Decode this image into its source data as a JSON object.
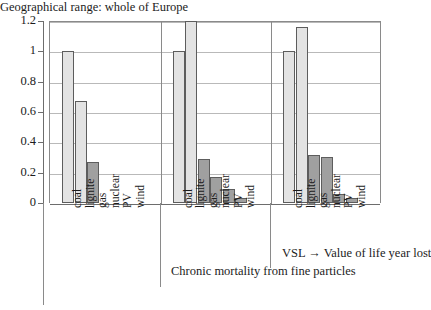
{
  "chart_data": {
    "type": "bar",
    "title": "",
    "xlabel": "",
    "ylabel": "",
    "ylim": [
      0,
      1.2
    ],
    "yticks": [
      0,
      0.2,
      0.4,
      0.6,
      0.8,
      1,
      1.2
    ],
    "ytick_labels": [
      "0",
      "0.2",
      "0.4",
      "0.6",
      "0.8",
      "1",
      "1.2"
    ],
    "grid": true,
    "legend": "none",
    "categories": [
      "coal",
      "lignite",
      "gas",
      "nuclear",
      "PV",
      "wind"
    ],
    "groups": [
      {
        "name": "group-1",
        "values": [
          1.0,
          0.67,
          0.27,
          0.0,
          0.0,
          0.0
        ],
        "shades": [
          "light",
          "light",
          "dark",
          "dark",
          "dark",
          "dark"
        ]
      },
      {
        "name": "group-2",
        "values": [
          1.0,
          1.2,
          0.29,
          0.17,
          0.09,
          0.03
        ],
        "shades": [
          "light",
          "light",
          "dark",
          "dark",
          "dark",
          "dark"
        ]
      },
      {
        "name": "group-3",
        "values": [
          1.0,
          1.16,
          0.315,
          0.305,
          0.06,
          0.03
        ],
        "shades": [
          "light",
          "light",
          "dark",
          "dark",
          "dark",
          "dark"
        ]
      }
    ],
    "annotations": [
      "VSL → Value of life year lost",
      "Chronic mortality from fine particles",
      "Geographical range: whole of Europe"
    ],
    "colors": {
      "bar_light": "#e3e3e3",
      "bar_dark": "#a0a0a0",
      "bar_outline": "#5d5d5d",
      "gridline": "#b9b9b9",
      "axis": "#6d6d6d",
      "background": "#ffffff",
      "text": "#1c1c1c"
    }
  },
  "captions": {
    "vsl": "VSL → Value of life year lost",
    "chronic": "Chronic mortality from fine particles",
    "geographical": "Geographical range: whole of Europe"
  }
}
